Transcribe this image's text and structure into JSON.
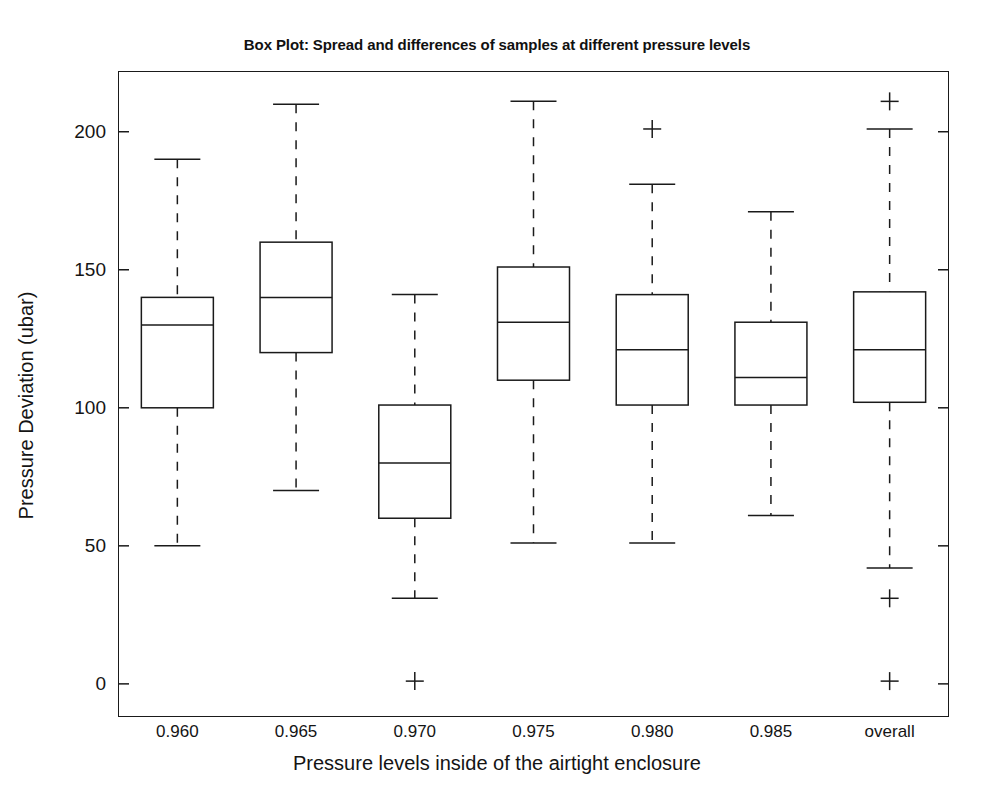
{
  "chart_data": {
    "type": "box",
    "title": "Box Plot: Spread and differences of samples at different pressure levels",
    "xlabel": "Pressure levels inside of the airtight enclosure",
    "ylabel": "Pressure Deviation (ubar)",
    "categories": [
      "0.960",
      "0.965",
      "0.970",
      "0.975",
      "0.980",
      "0.985",
      "overall"
    ],
    "ylim": [
      -12,
      222
    ],
    "yticks": [
      0,
      50,
      100,
      150,
      200
    ],
    "ytick_labels": [
      "0",
      "50",
      "100",
      "150",
      "200"
    ],
    "grid": false,
    "legend": null,
    "line_color": "#1a1a1a",
    "box_fill": "#ffffff",
    "boxes": [
      {
        "category": "0.960",
        "whisker_low": 50,
        "q1": 100,
        "median": 130,
        "q3": 140,
        "whisker_high": 190,
        "outliers": []
      },
      {
        "category": "0.965",
        "whisker_low": 70,
        "q1": 120,
        "median": 140,
        "q3": 160,
        "whisker_high": 210,
        "outliers": []
      },
      {
        "category": "0.970",
        "whisker_low": 31,
        "q1": 60,
        "median": 80,
        "q3": 101,
        "whisker_high": 141,
        "outliers": [
          1
        ]
      },
      {
        "category": "0.975",
        "whisker_low": 51,
        "q1": 110,
        "median": 131,
        "q3": 151,
        "whisker_high": 211,
        "outliers": []
      },
      {
        "category": "0.980",
        "whisker_low": 51,
        "q1": 101,
        "median": 121,
        "q3": 141,
        "whisker_high": 181,
        "outliers": [
          201
        ]
      },
      {
        "category": "0.985",
        "whisker_low": 61,
        "q1": 101,
        "median": 111,
        "q3": 131,
        "whisker_high": 171,
        "outliers": []
      },
      {
        "category": "overall",
        "whisker_low": 42,
        "q1": 102,
        "median": 121,
        "q3": 142,
        "whisker_high": 201,
        "outliers": [
          211,
          31,
          1
        ]
      }
    ]
  }
}
